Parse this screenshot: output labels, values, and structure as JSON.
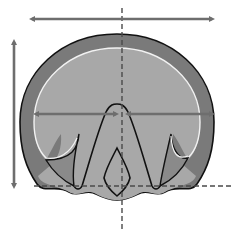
{
  "diagram": {
    "colors": {
      "background": "#ffffff",
      "wall": "#7a7a7a",
      "sole": "#a8a8a8",
      "outline": "#111111",
      "white_line": "#f2f2f2",
      "arrow": "#6e6e6e",
      "dashed_line": "#4a4a4a"
    },
    "elements": [
      {
        "id": "width-arrow-top",
        "type": "double-arrow",
        "orientation": "horizontal"
      },
      {
        "id": "length-arrow-left",
        "type": "double-arrow",
        "orientation": "vertical"
      },
      {
        "id": "inner-width-arrow",
        "type": "double-arrow",
        "orientation": "horizontal"
      },
      {
        "id": "center-axis",
        "type": "dashed-line",
        "orientation": "vertical"
      },
      {
        "id": "heel-line",
        "type": "dashed-line",
        "orientation": "horizontal"
      },
      {
        "id": "hoof-wall",
        "type": "shape"
      },
      {
        "id": "sole",
        "type": "shape"
      },
      {
        "id": "white-line",
        "type": "curve"
      },
      {
        "id": "frog",
        "type": "shape"
      },
      {
        "id": "central-sulcus",
        "type": "shape"
      },
      {
        "id": "bars",
        "type": "shape"
      }
    ]
  }
}
